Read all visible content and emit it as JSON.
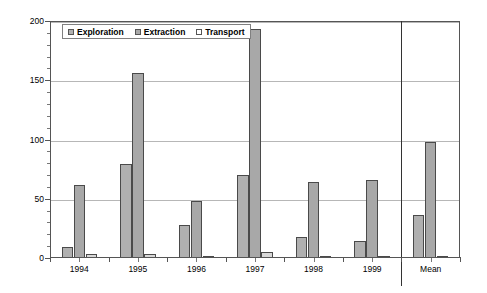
{
  "chart_data": {
    "type": "bar",
    "title": "",
    "xlabel": "",
    "ylabel": "Number of accidents",
    "ylim": [
      0,
      200
    ],
    "ytick_values": [
      0,
      50,
      100,
      150,
      200
    ],
    "ytick_labels": [
      "0",
      "50",
      "100",
      "150",
      "200"
    ],
    "minor_tick_step": 10,
    "grid": true,
    "grid_axis": "y",
    "legend_position": "top-left-inside",
    "categories": [
      "1994",
      "1995",
      "1996",
      "1997",
      "1998",
      "1999",
      "Mean"
    ],
    "series": [
      {
        "name": "Exploration",
        "color": "#b0b0b0",
        "values": [
          9,
          79,
          28,
          70,
          18,
          14,
          36
        ]
      },
      {
        "name": "Extraction",
        "color": "#a8a8a8",
        "values": [
          62,
          156,
          48,
          193,
          64,
          66,
          98
        ]
      },
      {
        "name": "Transport",
        "color": "#ffffff",
        "values": [
          3,
          3,
          1,
          5,
          2,
          2,
          2
        ]
      }
    ],
    "annotations": {
      "separator_after_category": "1999",
      "separator_label": "Mean"
    }
  },
  "colors": {
    "background": "#ffffff",
    "axis": "#555555",
    "grid": "#b7b7b7",
    "bar_outline": "#4a4a4a",
    "text": "#000000",
    "separator": "#333333"
  }
}
